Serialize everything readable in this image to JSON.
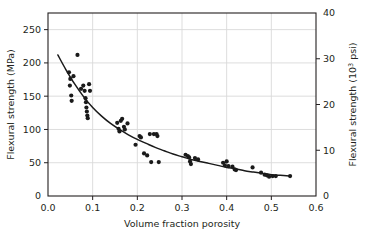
{
  "chart_data": {
    "type": "scatter",
    "title": "",
    "xlabel": "Volume fraction porosity",
    "ylabel": "Flexural strength (MPa)",
    "y2label_main": "Flexural strength (10",
    "y2label_sup": "3",
    "y2label_tail": " psi)",
    "xlim": [
      0.0,
      0.6
    ],
    "ylim": [
      0,
      275
    ],
    "y2lim": [
      0,
      40
    ],
    "grid": true,
    "legend": null,
    "xticks": [
      "0.0",
      "0.1",
      "0.2",
      "0.3",
      "0.4",
      "0.5",
      "0.6"
    ],
    "xtick_values": [
      0.0,
      0.1,
      0.2,
      0.3,
      0.4,
      0.5,
      0.6
    ],
    "yticks": [
      "0",
      "50",
      "100",
      "150",
      "200",
      "250"
    ],
    "ytick_values": [
      0,
      50,
      100,
      150,
      200,
      250
    ],
    "y2ticks": [
      "0",
      "10",
      "20",
      "30",
      "40"
    ],
    "y2tick_values": [
      0,
      10,
      20,
      30,
      40
    ],
    "series": [
      {
        "name": "measured data",
        "marker": "filled-circle",
        "color": "#1a1a1a",
        "points": [
          [
            0.047,
            186
          ],
          [
            0.05,
            176
          ],
          [
            0.049,
            166
          ],
          [
            0.052,
            151
          ],
          [
            0.053,
            143
          ],
          [
            0.057,
            180
          ],
          [
            0.066,
            212
          ],
          [
            0.074,
            161
          ],
          [
            0.079,
            166
          ],
          [
            0.082,
            158
          ],
          [
            0.084,
            147
          ],
          [
            0.085,
            141
          ],
          [
            0.086,
            133
          ],
          [
            0.087,
            127
          ],
          [
            0.088,
            121
          ],
          [
            0.089,
            117
          ],
          [
            0.092,
            168
          ],
          [
            0.094,
            158
          ],
          [
            0.155,
            110
          ],
          [
            0.158,
            101
          ],
          [
            0.16,
            97
          ],
          [
            0.163,
            113
          ],
          [
            0.166,
            116
          ],
          [
            0.17,
            104
          ],
          [
            0.172,
            100
          ],
          [
            0.178,
            109
          ],
          [
            0.196,
            77
          ],
          [
            0.205,
            90
          ],
          [
            0.208,
            88
          ],
          [
            0.215,
            64
          ],
          [
            0.222,
            61
          ],
          [
            0.228,
            93
          ],
          [
            0.231,
            51
          ],
          [
            0.237,
            93
          ],
          [
            0.243,
            93
          ],
          [
            0.245,
            90
          ],
          [
            0.248,
            51
          ],
          [
            0.308,
            62
          ],
          [
            0.313,
            60
          ],
          [
            0.316,
            58
          ],
          [
            0.318,
            52
          ],
          [
            0.32,
            48
          ],
          [
            0.329,
            57
          ],
          [
            0.336,
            55
          ],
          [
            0.392,
            50
          ],
          [
            0.396,
            46
          ],
          [
            0.4,
            52
          ],
          [
            0.404,
            45
          ],
          [
            0.413,
            44
          ],
          [
            0.418,
            40
          ],
          [
            0.421,
            39
          ],
          [
            0.458,
            43
          ],
          [
            0.477,
            35
          ],
          [
            0.485,
            32
          ],
          [
            0.49,
            31
          ],
          [
            0.495,
            29
          ],
          [
            0.503,
            30
          ],
          [
            0.51,
            30
          ],
          [
            0.542,
            30
          ]
        ]
      }
    ],
    "fit_curve": {
      "name": "exponential fit",
      "color": "#1a1a1a",
      "points": [
        [
          0.022,
          212
        ],
        [
          0.04,
          190
        ],
        [
          0.06,
          168
        ],
        [
          0.08,
          149
        ],
        [
          0.1,
          133
        ],
        [
          0.12,
          120
        ],
        [
          0.14,
          109
        ],
        [
          0.16,
          100
        ],
        [
          0.18,
          92
        ],
        [
          0.2,
          85
        ],
        [
          0.22,
          79
        ],
        [
          0.24,
          73
        ],
        [
          0.26,
          68
        ],
        [
          0.28,
          63
        ],
        [
          0.3,
          59
        ],
        [
          0.32,
          55
        ],
        [
          0.34,
          52
        ],
        [
          0.36,
          49
        ],
        [
          0.38,
          46
        ],
        [
          0.4,
          43
        ],
        [
          0.42,
          41
        ],
        [
          0.44,
          38
        ],
        [
          0.46,
          36
        ],
        [
          0.48,
          34
        ],
        [
          0.5,
          32
        ],
        [
          0.52,
          31
        ],
        [
          0.54,
          30
        ]
      ]
    },
    "colors": {
      "axis": "#231f20",
      "grid": "#d9d9d9",
      "marker": "#1a1a1a",
      "curve": "#1a1a1a",
      "background": "#ffffff"
    }
  }
}
